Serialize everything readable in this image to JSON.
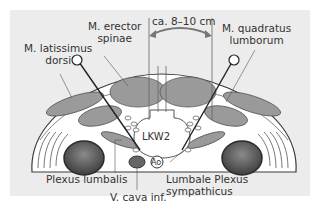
{
  "figure": {
    "labels": {
      "erector": [
        "M. erector",
        "spinae"
      ],
      "latissimus": [
        "M. latissimus",
        "dorsi"
      ],
      "distance": "ca. 8–10 cm",
      "quadratus": [
        "M. quadratus",
        "lumborum"
      ],
      "vertebra": "LKW2",
      "aorta": "Ao",
      "plexus_lumbalis": "Plexus lumbalis",
      "vena_cava": "V. cava inf.",
      "sympathicus": [
        "Lumbale Plexus",
        "sympathicus"
      ]
    },
    "colors": {
      "background": "#ececec",
      "muscle": "#9a9a9a",
      "body": "#ffffff",
      "outline": "#3a3a3a",
      "kidney": "#5a5a5a"
    }
  }
}
